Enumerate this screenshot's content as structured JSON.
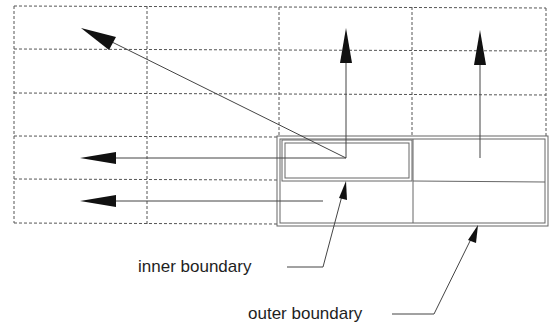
{
  "diagram": {
    "type": "boundary-extension-diagram",
    "colors": {
      "background": "#ffffff",
      "grid": "#555555",
      "boundary": "#666666",
      "arrow": "#111111",
      "line": "#555555",
      "text": "#1e1e1e"
    },
    "grid": {
      "style": "dashed",
      "columns": 4,
      "rows": 5
    },
    "labels": {
      "inner_boundary": "inner boundary",
      "outer_boundary": "outer boundary"
    },
    "arrows": [
      {
        "name": "diagonal-arrow",
        "direction": "up-left"
      },
      {
        "name": "vertical-arrow-left",
        "direction": "up"
      },
      {
        "name": "vertical-arrow-right",
        "direction": "up"
      },
      {
        "name": "horizontal-arrow-upper",
        "direction": "left"
      },
      {
        "name": "horizontal-arrow-lower",
        "direction": "left"
      }
    ]
  }
}
